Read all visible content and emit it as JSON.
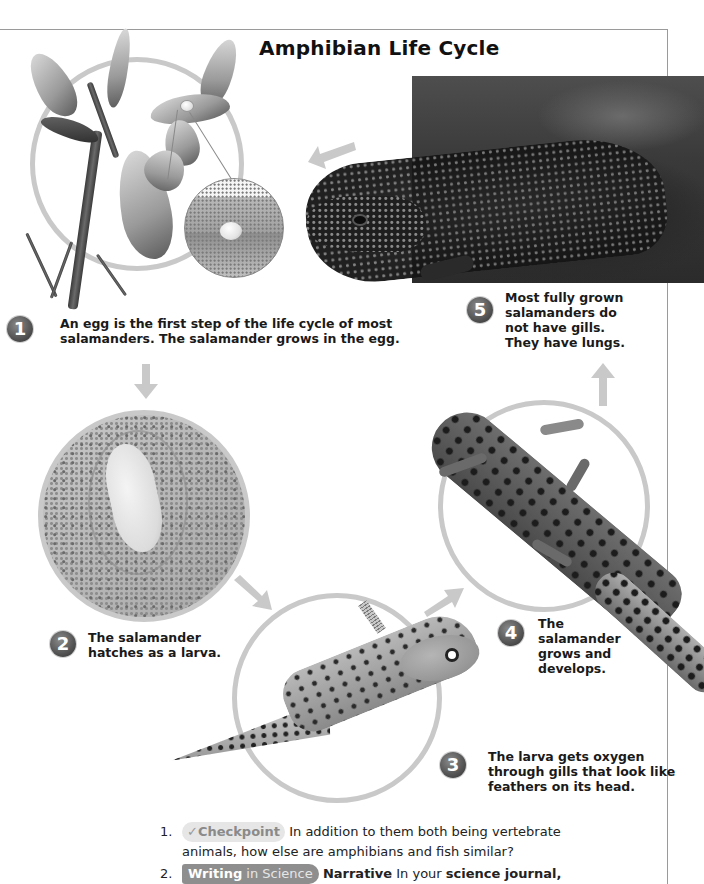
{
  "page": {
    "title": "Amphibian Life Cycle"
  },
  "stages": [
    {
      "number": "1",
      "caption_line1": "An egg is the first step of the life cycle of most",
      "caption_line2": "salamanders. The salamander grows in the egg."
    },
    {
      "number": "2",
      "caption_line1": "The salamander",
      "caption_line2": "hatches as a larva."
    },
    {
      "number": "3",
      "caption_line1": "The larva gets oxygen",
      "caption_line2": "through gills that look like",
      "caption_line3": "feathers on its head."
    },
    {
      "number": "4",
      "caption_line1": "The",
      "caption_line2": "salamander",
      "caption_line3": "grows and",
      "caption_line4": "develops."
    },
    {
      "number": "5",
      "caption_line1": "Most fully grown",
      "caption_line2": "salamanders do",
      "caption_line3": "not have gills.",
      "caption_line4": "They have lungs."
    }
  ],
  "images": {
    "stage1": "egg-on-plant-photo",
    "stage2": "embryo-in-egg-photo",
    "stage3": "larva-with-gills-photo",
    "stage4": "juvenile-salamander-photo",
    "stage5": "adult-salamander-photo"
  },
  "questions": [
    {
      "number": "1.",
      "tag_icon": "✓",
      "tag_label": "Checkpoint",
      "text_line1": "In addition to them both being vertebrate",
      "text_line2": "animals, how else are amphibians and fish similar?"
    },
    {
      "number": "2.",
      "tag_bold": "Writing",
      "tag_light": "in Science",
      "label": "Narrative",
      "text_pre": "In your",
      "text_bold": "science journal,"
    }
  ],
  "colors": {
    "ring": "#c9c9c9",
    "arrow": "#c9c9c9",
    "badge": "#555555",
    "frame": "#9a9a9a",
    "text": "#1a1a1a"
  }
}
